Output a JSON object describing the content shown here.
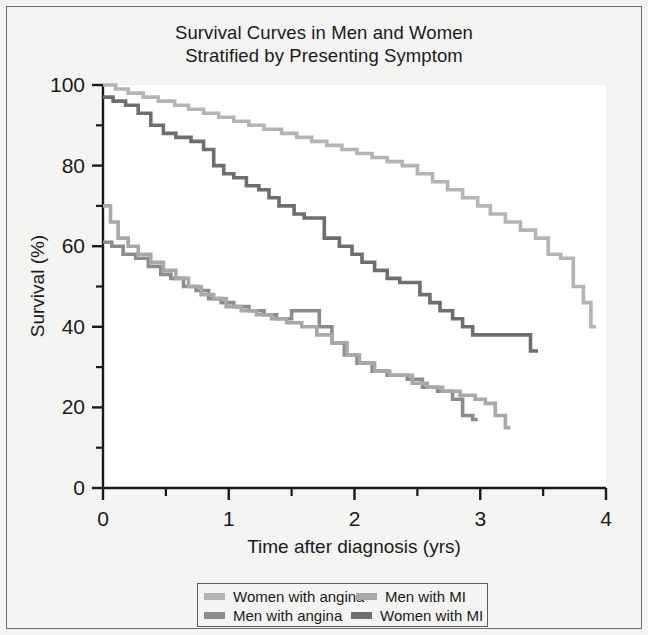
{
  "chart_data": {
    "type": "line",
    "title": "Survival Curves in Men and Women Stratified by Presenting Symptom",
    "title_lines": [
      "Survival Curves in Men and Women",
      "Stratified by Presenting Symptom"
    ],
    "xlabel": "Time after diagnosis (yrs)",
    "ylabel": "Survival (%)",
    "xlim": [
      0,
      4
    ],
    "ylim": [
      0,
      100
    ],
    "xticks": [
      0,
      1,
      2,
      3,
      4
    ],
    "xticklabels": [
      "0",
      "1",
      "2",
      "3",
      "4"
    ],
    "xminorticks": [
      0.5,
      1.5,
      2.5,
      3.5
    ],
    "yticks": [
      0,
      20,
      40,
      60,
      80,
      100
    ],
    "yticklabels": [
      "0",
      "20",
      "40",
      "60",
      "80",
      "100"
    ],
    "yminorticks": [
      10,
      30,
      50,
      70,
      90
    ],
    "grid": false,
    "legend_position": "below-axes",
    "step_style": "post",
    "series": [
      {
        "name": "Women with angina",
        "color": "#b4b4b4",
        "points": [
          [
            0.0,
            100
          ],
          [
            0.08,
            100
          ],
          [
            0.1,
            99
          ],
          [
            0.18,
            99
          ],
          [
            0.2,
            98
          ],
          [
            0.3,
            98
          ],
          [
            0.32,
            97
          ],
          [
            0.42,
            97
          ],
          [
            0.44,
            96
          ],
          [
            0.55,
            96
          ],
          [
            0.57,
            95
          ],
          [
            0.66,
            95
          ],
          [
            0.68,
            94
          ],
          [
            0.78,
            94
          ],
          [
            0.8,
            93
          ],
          [
            0.9,
            93
          ],
          [
            0.92,
            92
          ],
          [
            1.02,
            92
          ],
          [
            1.04,
            91
          ],
          [
            1.14,
            91
          ],
          [
            1.16,
            90
          ],
          [
            1.26,
            90
          ],
          [
            1.28,
            89
          ],
          [
            1.4,
            89
          ],
          [
            1.42,
            88
          ],
          [
            1.52,
            88
          ],
          [
            1.54,
            87
          ],
          [
            1.64,
            87
          ],
          [
            1.66,
            86
          ],
          [
            1.76,
            86
          ],
          [
            1.78,
            85
          ],
          [
            1.88,
            85
          ],
          [
            1.9,
            84
          ],
          [
            2.0,
            84
          ],
          [
            2.02,
            83
          ],
          [
            2.12,
            83
          ],
          [
            2.14,
            82
          ],
          [
            2.24,
            82
          ],
          [
            2.26,
            81
          ],
          [
            2.36,
            81
          ],
          [
            2.38,
            80
          ],
          [
            2.48,
            80
          ],
          [
            2.5,
            78
          ],
          [
            2.6,
            78
          ],
          [
            2.62,
            76
          ],
          [
            2.72,
            76
          ],
          [
            2.74,
            74
          ],
          [
            2.84,
            74
          ],
          [
            2.86,
            72
          ],
          [
            2.96,
            72
          ],
          [
            2.98,
            70
          ],
          [
            3.06,
            70
          ],
          [
            3.08,
            68
          ],
          [
            3.18,
            68
          ],
          [
            3.2,
            66
          ],
          [
            3.3,
            66
          ],
          [
            3.32,
            64
          ],
          [
            3.42,
            64
          ],
          [
            3.44,
            62
          ],
          [
            3.52,
            62
          ],
          [
            3.54,
            58
          ],
          [
            3.62,
            58
          ],
          [
            3.64,
            57
          ],
          [
            3.72,
            57
          ],
          [
            3.74,
            50
          ],
          [
            3.8,
            50
          ],
          [
            3.82,
            46
          ],
          [
            3.86,
            46
          ],
          [
            3.88,
            40
          ],
          [
            3.92,
            40
          ]
        ]
      },
      {
        "name": "Men with angina",
        "color": "#8c8c8c",
        "points": [
          [
            0.0,
            61
          ],
          [
            0.05,
            61
          ],
          [
            0.07,
            60
          ],
          [
            0.14,
            60
          ],
          [
            0.16,
            58
          ],
          [
            0.24,
            58
          ],
          [
            0.26,
            57
          ],
          [
            0.34,
            57
          ],
          [
            0.36,
            55
          ],
          [
            0.44,
            55
          ],
          [
            0.46,
            53
          ],
          [
            0.52,
            53
          ],
          [
            0.54,
            52
          ],
          [
            0.62,
            52
          ],
          [
            0.64,
            50
          ],
          [
            0.72,
            50
          ],
          [
            0.74,
            49
          ],
          [
            0.82,
            49
          ],
          [
            0.84,
            47
          ],
          [
            0.92,
            47
          ],
          [
            0.94,
            46
          ],
          [
            1.02,
            46
          ],
          [
            1.04,
            45
          ],
          [
            1.14,
            45
          ],
          [
            1.16,
            44
          ],
          [
            1.26,
            44
          ],
          [
            1.28,
            43
          ],
          [
            1.36,
            43
          ],
          [
            1.38,
            42
          ],
          [
            1.48,
            42
          ],
          [
            1.5,
            44
          ],
          [
            1.7,
            44
          ],
          [
            1.72,
            40
          ],
          [
            1.8,
            40
          ],
          [
            1.82,
            36
          ],
          [
            1.9,
            36
          ],
          [
            1.92,
            33
          ],
          [
            2.0,
            33
          ],
          [
            2.02,
            31
          ],
          [
            2.12,
            31
          ],
          [
            2.14,
            29
          ],
          [
            2.24,
            29
          ],
          [
            2.26,
            28
          ],
          [
            2.4,
            28
          ],
          [
            2.42,
            27
          ],
          [
            2.52,
            27
          ],
          [
            2.54,
            25
          ],
          [
            2.64,
            25
          ],
          [
            2.66,
            24
          ],
          [
            2.76,
            24
          ],
          [
            2.78,
            22
          ],
          [
            2.84,
            22
          ],
          [
            2.86,
            18
          ],
          [
            2.92,
            18
          ],
          [
            2.94,
            17
          ],
          [
            2.98,
            17
          ]
        ]
      },
      {
        "name": "Men with MI",
        "color": "#a8a8a8",
        "points": [
          [
            0.0,
            70
          ],
          [
            0.04,
            70
          ],
          [
            0.06,
            66
          ],
          [
            0.1,
            66
          ],
          [
            0.12,
            62
          ],
          [
            0.18,
            62
          ],
          [
            0.2,
            60
          ],
          [
            0.26,
            60
          ],
          [
            0.28,
            58
          ],
          [
            0.36,
            58
          ],
          [
            0.38,
            56
          ],
          [
            0.46,
            56
          ],
          [
            0.48,
            54
          ],
          [
            0.56,
            54
          ],
          [
            0.58,
            52
          ],
          [
            0.66,
            52
          ],
          [
            0.68,
            50
          ],
          [
            0.76,
            50
          ],
          [
            0.78,
            48
          ],
          [
            0.86,
            48
          ],
          [
            0.88,
            47
          ],
          [
            0.96,
            47
          ],
          [
            0.98,
            45
          ],
          [
            1.08,
            45
          ],
          [
            1.1,
            44
          ],
          [
            1.2,
            44
          ],
          [
            1.22,
            43
          ],
          [
            1.32,
            43
          ],
          [
            1.34,
            42
          ],
          [
            1.44,
            42
          ],
          [
            1.46,
            41
          ],
          [
            1.56,
            41
          ],
          [
            1.58,
            40
          ],
          [
            1.68,
            40
          ],
          [
            1.7,
            38
          ],
          [
            1.8,
            38
          ],
          [
            1.82,
            36
          ],
          [
            1.92,
            36
          ],
          [
            1.94,
            33
          ],
          [
            2.02,
            33
          ],
          [
            2.04,
            31
          ],
          [
            2.14,
            31
          ],
          [
            2.16,
            29
          ],
          [
            2.26,
            29
          ],
          [
            2.28,
            28
          ],
          [
            2.44,
            28
          ],
          [
            2.46,
            26
          ],
          [
            2.56,
            26
          ],
          [
            2.58,
            25
          ],
          [
            2.68,
            25
          ],
          [
            2.7,
            24
          ],
          [
            2.82,
            24
          ],
          [
            2.84,
            23
          ],
          [
            2.94,
            23
          ],
          [
            2.96,
            22
          ],
          [
            3.02,
            22
          ],
          [
            3.04,
            21
          ],
          [
            3.1,
            21
          ],
          [
            3.12,
            18
          ],
          [
            3.18,
            18
          ],
          [
            3.2,
            15
          ],
          [
            3.24,
            15
          ]
        ]
      },
      {
        "name": "Women with MI",
        "color": "#6e6e6e",
        "points": [
          [
            0.0,
            97
          ],
          [
            0.06,
            97
          ],
          [
            0.08,
            96
          ],
          [
            0.16,
            96
          ],
          [
            0.18,
            95
          ],
          [
            0.26,
            95
          ],
          [
            0.28,
            93
          ],
          [
            0.36,
            93
          ],
          [
            0.38,
            90
          ],
          [
            0.46,
            90
          ],
          [
            0.48,
            88
          ],
          [
            0.56,
            88
          ],
          [
            0.58,
            87
          ],
          [
            0.68,
            87
          ],
          [
            0.7,
            86
          ],
          [
            0.78,
            86
          ],
          [
            0.8,
            84
          ],
          [
            0.86,
            84
          ],
          [
            0.88,
            80
          ],
          [
            0.94,
            80
          ],
          [
            0.96,
            78
          ],
          [
            1.02,
            78
          ],
          [
            1.04,
            77
          ],
          [
            1.12,
            77
          ],
          [
            1.14,
            75
          ],
          [
            1.22,
            75
          ],
          [
            1.24,
            74
          ],
          [
            1.3,
            74
          ],
          [
            1.32,
            72
          ],
          [
            1.38,
            72
          ],
          [
            1.4,
            70
          ],
          [
            1.5,
            70
          ],
          [
            1.52,
            68
          ],
          [
            1.58,
            68
          ],
          [
            1.6,
            67
          ],
          [
            1.74,
            67
          ],
          [
            1.76,
            62
          ],
          [
            1.86,
            62
          ],
          [
            1.88,
            60
          ],
          [
            1.96,
            60
          ],
          [
            1.98,
            58
          ],
          [
            2.04,
            58
          ],
          [
            2.06,
            56
          ],
          [
            2.14,
            56
          ],
          [
            2.16,
            54
          ],
          [
            2.24,
            54
          ],
          [
            2.26,
            52
          ],
          [
            2.34,
            52
          ],
          [
            2.36,
            51
          ],
          [
            2.5,
            51
          ],
          [
            2.52,
            48
          ],
          [
            2.58,
            48
          ],
          [
            2.6,
            46
          ],
          [
            2.66,
            46
          ],
          [
            2.68,
            44
          ],
          [
            2.76,
            44
          ],
          [
            2.78,
            42
          ],
          [
            2.84,
            42
          ],
          [
            2.86,
            40
          ],
          [
            2.92,
            40
          ],
          [
            2.94,
            38
          ],
          [
            3.38,
            38
          ],
          [
            3.4,
            34
          ],
          [
            3.46,
            34
          ]
        ]
      }
    ]
  },
  "legend": {
    "rows": [
      [
        {
          "label": "Women with angina",
          "color": "#b4b4b4"
        },
        {
          "label": "Men with MI",
          "color": "#a8a8a8"
        }
      ],
      [
        {
          "label": "Men with angina",
          "color": "#8c8c8c"
        },
        {
          "label": "Women with MI",
          "color": "#6e6e6e"
        }
      ]
    ]
  },
  "axes": {
    "background": "#ffffff",
    "line_color": "#1a1a1a"
  }
}
